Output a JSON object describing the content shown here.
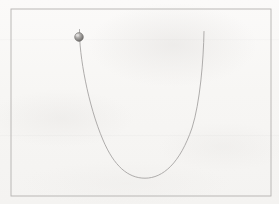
{
  "figure": {
    "background_color": "#f8f7f5",
    "frame": {
      "label": "figure-border",
      "stroke_color": "#b4b2b0",
      "stroke_width": 0.9,
      "x": 11,
      "y": 9,
      "width": 260,
      "height": 187
    },
    "curve": {
      "label": "wire-curve",
      "shape": "u-shaped",
      "stroke_color": "#a6a4a3",
      "stroke_width": 0.9,
      "path": "M 79.5 29.5 C 79.0 55.0 88.0 105.0 103.0 140.0 C 114.0 166.0 128.0 178.2 145.0 178.2 C 163.0 178.2 180.0 163.0 192.0 128.0 C 200.0 103.0 203.5 60.0 204.0 31.5",
      "start_point": [
        79.5,
        29.5
      ],
      "minimum_point": [
        145,
        178
      ],
      "end_point": [
        204,
        31.5
      ]
    },
    "bead": {
      "label": "bead-sphere",
      "center_x": 79,
      "center_y": 37,
      "radius": 4.4,
      "fill_color": "#8e8c8a",
      "highlight_color": "#dedcda",
      "edge_color": "#6f6d6b"
    }
  },
  "chart_data": {
    "type": "line",
    "xlabel": "",
    "ylabel": "",
    "xlim": [
      11,
      271
    ],
    "ylim": [
      196,
      9
    ],
    "grid": false,
    "legend": null,
    "series": [
      {
        "name": "wire-curve",
        "x": [
          79.5,
          86,
          94,
          103,
          114,
          128,
          145,
          163,
          180,
          192,
          200,
          204
        ],
        "y": [
          29.5,
          72,
          110,
          140,
          166,
          176,
          178,
          176,
          163,
          128,
          76,
          31.5
        ]
      }
    ],
    "annotations": [
      {
        "name": "bead",
        "x": 79,
        "y": 37,
        "marker": "sphere"
      }
    ]
  }
}
